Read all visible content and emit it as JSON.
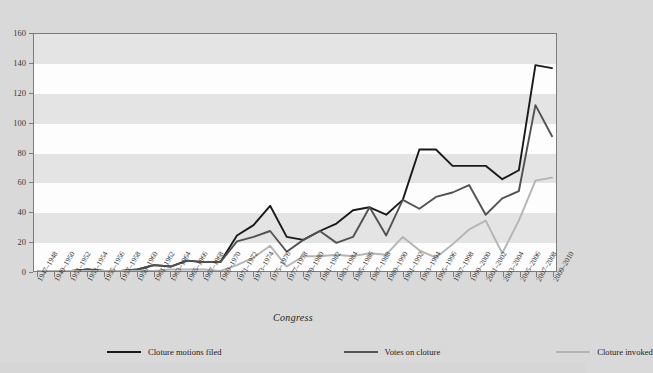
{
  "chart_data": {
    "type": "line",
    "title": "",
    "xlabel": "Congress",
    "ylabel": "",
    "ylim": [
      0,
      160
    ],
    "ytick_step": 20,
    "yticks": [
      "0",
      "20",
      "40",
      "60",
      "80",
      "100",
      "120",
      "140",
      "160"
    ],
    "grid": "horizontal-bands",
    "legend_position": "bottom",
    "categories": [
      "1947–1948",
      "1949–1950",
      "1951–1952",
      "1953–1954",
      "1955–1956",
      "1957–1958",
      "1959–1960",
      "1961–1962",
      "1963–1964",
      "1965–1966",
      "1967–1968",
      "1969–1970",
      "1971–1972",
      "1973–1974",
      "1975–1976",
      "1977–1978",
      "1979–1980",
      "1981–1982",
      "1983–1984",
      "1985–1986",
      "1987–1988",
      "1989–1990",
      "1991–1992",
      "1993–1994",
      "1995–1996",
      "1997–1998",
      "1999–2000",
      "2001–2002",
      "2003–2004",
      "2005–2006",
      "2007–2008",
      "2009–2010"
    ],
    "series": [
      {
        "name": "Cloture motions filed",
        "color": "#1a1a1a",
        "values": [
          0,
          0,
          0,
          1,
          0,
          0,
          1,
          4,
          3,
          7,
          6,
          6,
          24,
          31,
          44,
          23,
          21,
          27,
          32,
          41,
          43,
          38,
          48,
          82,
          82,
          71,
          71,
          71,
          62,
          68,
          139,
          137
        ]
      },
      {
        "name": "Votes on cloture",
        "color": "#525252",
        "values": [
          0,
          0,
          0,
          1,
          0,
          0,
          1,
          4,
          3,
          7,
          6,
          6,
          20,
          23,
          27,
          13,
          21,
          27,
          19,
          23,
          43,
          24,
          48,
          42,
          50,
          53,
          58,
          38,
          49,
          54,
          112,
          91
        ]
      },
      {
        "name": "Cloture invoked",
        "color": "#b4b4b4",
        "values": [
          0,
          0,
          0,
          0,
          0,
          0,
          0,
          0,
          1,
          1,
          1,
          0,
          4,
          9,
          17,
          3,
          10,
          10,
          11,
          10,
          12,
          11,
          23,
          14,
          9,
          18,
          28,
          34,
          12,
          34,
          61,
          63
        ]
      }
    ]
  }
}
